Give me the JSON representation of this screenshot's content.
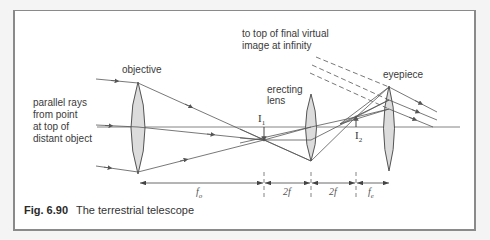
{
  "labels": {
    "objective": "objective",
    "erecting_line1": "erecting",
    "erecting_line2": "lens",
    "eyepiece": "eyepiece",
    "final_image_line1": "to top of final virtual",
    "final_image_line2": "image at infinity",
    "parallel_line1": "parallel rays",
    "parallel_line2": "from point",
    "parallel_line3": "at top of",
    "parallel_line4": "distant object"
  },
  "images": {
    "i1": {
      "main": "I",
      "sub": "1"
    },
    "i2": {
      "main": "I",
      "sub": "2"
    }
  },
  "dimensions": {
    "fo": {
      "main": "f",
      "sub": "o"
    },
    "two_f_1": "2f",
    "two_f_2": "2f",
    "fe": {
      "main": "f",
      "sub": "e"
    }
  },
  "caption": {
    "fig_number": "Fig. 6.90",
    "title": "The terrestrial telescope"
  },
  "colors": {
    "lens_fill": "#dcdcdc",
    "ray": "#555555",
    "frame": "#8a8a8a"
  }
}
